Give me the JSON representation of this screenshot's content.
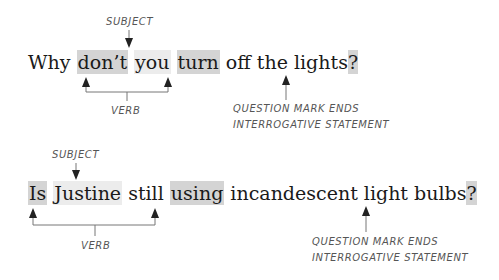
{
  "example1": {
    "subject_label": "SUBJECT",
    "verb_label": "VERB",
    "question_caption_line1": "QUESTION MARK ENDS",
    "question_caption_line2": "INTERROGATIVE STATEMENT",
    "words": {
      "w1": "Why",
      "w2": "don’t",
      "w3": "you",
      "w4": "turn",
      "w5": "off the lights",
      "punct": "?"
    }
  },
  "example2": {
    "subject_label": "SUBJECT",
    "verb_label": "VERB",
    "question_caption_line1": "QUESTION MARK ENDS",
    "question_caption_line2": "INTERROGATIVE STATEMENT",
    "words": {
      "w1": "Is",
      "w2": "Justine",
      "w3": "still",
      "w4": "using",
      "w5": "incandescent light bulbs",
      "punct": "?"
    }
  },
  "colors": {
    "verb_highlight": "#d4d4d4",
    "subject_highlight": "#ececec",
    "text": "#1a1a1a",
    "annotation": "#555555",
    "arrow": "#333333"
  }
}
